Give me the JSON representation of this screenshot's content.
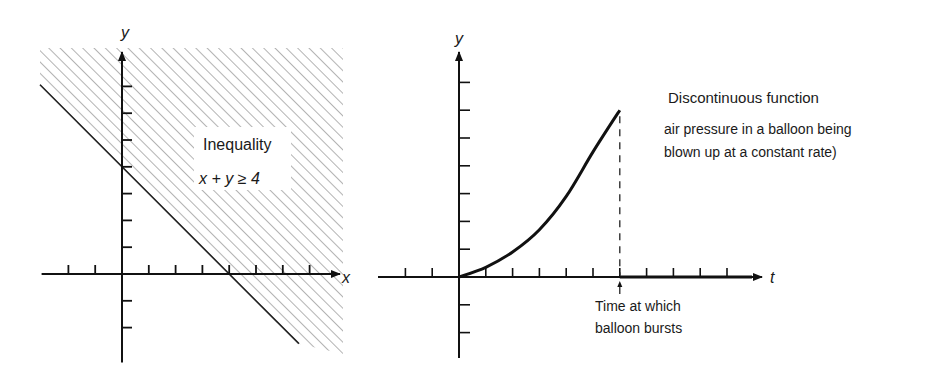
{
  "chart_data": [
    {
      "type": "area",
      "title": "Inequality",
      "equation": "x + y ≥ 4",
      "xlabel": "x",
      "ylabel": "y",
      "xlim": [
        -3,
        8
      ],
      "ylim": [
        -3.3,
        8
      ],
      "x_ticks": [
        -2,
        -1,
        1,
        2,
        3,
        4,
        5,
        6,
        7
      ],
      "y_ticks": [
        -2,
        -1,
        1,
        2,
        3,
        4,
        5,
        6,
        7
      ],
      "boundary_line": {
        "slope": -1,
        "intercept": 4,
        "x": [
          -3,
          6.6
        ],
        "y": [
          7,
          -2.6
        ]
      },
      "shaded_region": "above boundary (x + y >= 4)",
      "shading": "diagonal hatch",
      "grid": false
    },
    {
      "type": "line",
      "title": "Discontinuous function",
      "description": [
        "air pressure in a balloon being",
        "blown up at a constant rate)"
      ],
      "xlabel": "t",
      "ylabel": "y",
      "xlim": [
        -3,
        11
      ],
      "ylim": [
        -3,
        8
      ],
      "x_ticks": [
        -2,
        -1,
        1,
        2,
        3,
        4,
        5,
        6,
        7,
        8,
        9,
        10
      ],
      "y_ticks": [
        -2,
        -1,
        1,
        2,
        3,
        4,
        5,
        6,
        7
      ],
      "series": [
        {
          "name": "pressure before burst",
          "x": [
            0,
            1,
            2,
            3,
            4,
            5,
            6
          ],
          "y": [
            0,
            0.35,
            0.9,
            1.7,
            2.9,
            4.5,
            6.0
          ]
        },
        {
          "name": "pressure after burst",
          "x": [
            6,
            11
          ],
          "y": [
            0,
            0
          ]
        }
      ],
      "discontinuity_t": 6,
      "annotation": [
        "Time at which",
        "balloon bursts"
      ],
      "grid": false
    }
  ]
}
